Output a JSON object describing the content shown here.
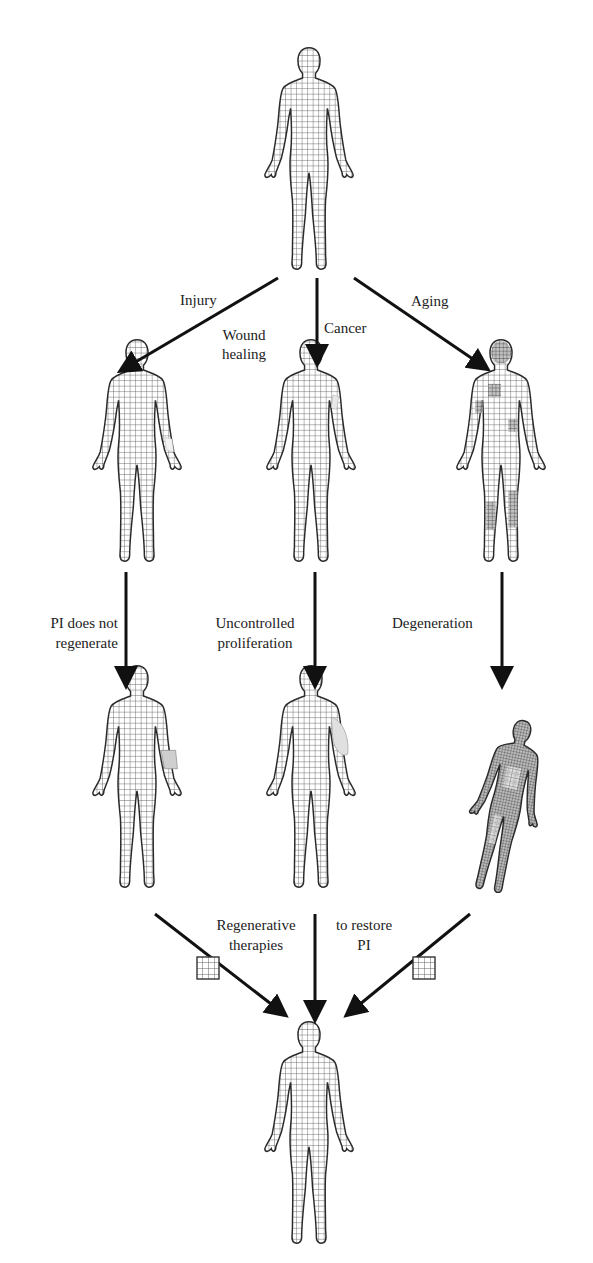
{
  "diagram": {
    "nodes": [
      {
        "id": "healthy-top",
        "state": "healthy body"
      },
      {
        "id": "injured",
        "state": "wound on arm"
      },
      {
        "id": "cancer",
        "state": "tumor on arm"
      },
      {
        "id": "aged",
        "state": "aged body with degenerated patches"
      },
      {
        "id": "pi-not-restored",
        "state": "missing arm tissue"
      },
      {
        "id": "proliferation",
        "state": "tumor growth on arm"
      },
      {
        "id": "degenerated",
        "state": "degenerated body"
      },
      {
        "id": "healthy-bottom",
        "state": "restored healthy body"
      }
    ],
    "edges": {
      "injury": "Injury",
      "wound_healing_line1": "Wound",
      "wound_healing_line2": "healing",
      "cancer": "Cancer",
      "aging": "Aging",
      "pi_not_regenerate_line1": "PI does not",
      "pi_not_regenerate_line2": "regenerate",
      "uncontrolled_line1": "Uncontrolled",
      "uncontrolled_line2": "proliferation",
      "degeneration": "Degeneration",
      "regenerative_line1": "Regenerative",
      "regenerative_line2": "therapies",
      "restore_line1": "to restore",
      "restore_line2": "PI"
    },
    "colors": {
      "line": "#111111",
      "grid": "#555555",
      "outline": "#2a2a2a",
      "aged_shade": "#6a6a6a"
    }
  }
}
